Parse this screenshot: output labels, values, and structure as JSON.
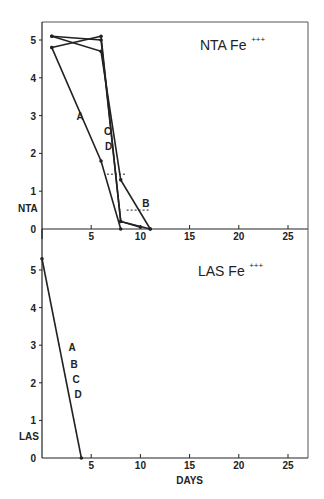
{
  "chart_data": [
    {
      "type": "line",
      "title": "NTA Fe+++",
      "title_main": "NTA  Fe",
      "title_sup": "+++",
      "xlabel": "",
      "ylabel": "NTA",
      "xlim": [
        0,
        27
      ],
      "ylim": [
        0,
        5.3
      ],
      "xticks": [
        5,
        10,
        15,
        20,
        25
      ],
      "yticks": [
        0,
        1,
        2,
        3,
        4,
        5
      ],
      "grid": false,
      "series": [
        {
          "name": "A",
          "x": [
            1,
            6,
            8
          ],
          "y": [
            4.8,
            1.8,
            0
          ]
        },
        {
          "name": "B",
          "x": [
            1,
            6,
            8,
            11
          ],
          "y": [
            5.1,
            4.7,
            1.3,
            0
          ]
        },
        {
          "name": "C",
          "x": [
            1,
            6,
            8,
            11
          ],
          "y": [
            5.1,
            5.0,
            0.2,
            0
          ]
        },
        {
          "name": "D",
          "x": [
            1,
            6,
            8,
            10
          ],
          "y": [
            4.8,
            5.1,
            0.2,
            0.05
          ]
        }
      ],
      "annotations": [
        {
          "text": "A",
          "x": 3.5,
          "y": 3.0
        },
        {
          "text": "C",
          "x": 6.3,
          "y": 2.6
        },
        {
          "text": "D",
          "x": 6.4,
          "y": 2.2
        },
        {
          "text": "B",
          "x": 10.2,
          "y": 0.7
        }
      ],
      "dashed_markers": [
        {
          "x_from": 6.6,
          "x_to": 8.6,
          "y": 1.45
        },
        {
          "x_from": 8.6,
          "x_to": 11.0,
          "y": 0.5
        }
      ]
    },
    {
      "type": "line",
      "title": "LAS Fe+++",
      "title_main": "LAS  Fe",
      "title_sup": "+++",
      "xlabel": "DAYS",
      "ylabel": "LAS",
      "xlim": [
        0,
        27
      ],
      "ylim": [
        0,
        5.3
      ],
      "xticks": [
        5,
        10,
        15,
        20,
        25
      ],
      "yticks": [
        0,
        1,
        2,
        3,
        4,
        5
      ],
      "grid": false,
      "series": [
        {
          "name": "A, B, C, D",
          "x": [
            0,
            4
          ],
          "y": [
            5.3,
            0
          ]
        }
      ],
      "annotations": [
        {
          "text": "A",
          "x": 2.7,
          "y": 2.95
        },
        {
          "text": "B",
          "x": 2.9,
          "y": 2.5
        },
        {
          "text": "C",
          "x": 3.1,
          "y": 2.1
        },
        {
          "text": "D",
          "x": 3.3,
          "y": 1.7
        }
      ]
    }
  ]
}
